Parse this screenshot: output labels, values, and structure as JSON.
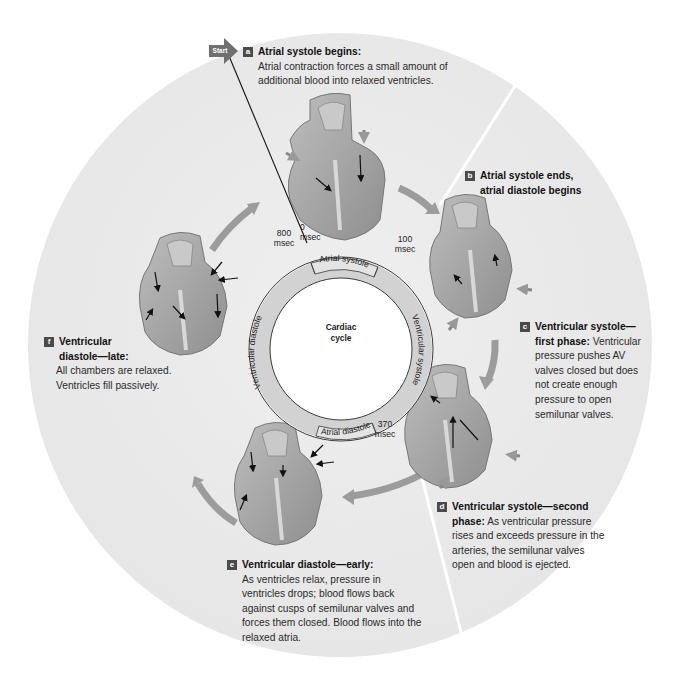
{
  "figure": {
    "title": "Cardiac cycle",
    "colors": {
      "background_disc": "#ebebeb",
      "ring_fill": "#d0d0d0",
      "ring_stroke": "#3a3a3a",
      "heart_fill": "#a8a8a8",
      "heart_dark": "#8a8a8a",
      "arrow_gray": "#9a9a9a",
      "badge": "#4a4a4a"
    }
  },
  "start_marker": {
    "label": "Start"
  },
  "center": {
    "line1": "Cardiac",
    "line2": "cycle"
  },
  "ring": {
    "segments": [
      {
        "label": "Atrial systole"
      },
      {
        "label": "Ventricular systole"
      },
      {
        "label": "Atrial diastole"
      },
      {
        "label": "Ventricular diastole"
      }
    ],
    "times": [
      {
        "value": "0",
        "unit": "msec"
      },
      {
        "value": "100",
        "unit": "msec"
      },
      {
        "value": "370",
        "unit": "msec"
      },
      {
        "value": "800",
        "unit": "msec"
      }
    ]
  },
  "steps": [
    {
      "letter": "a",
      "title": "Atrial systole begins:",
      "body": "Atrial contraction forces a small amount of additional blood into relaxed ventricles."
    },
    {
      "letter": "b",
      "title": "Atrial systole ends, atrial diastole begins",
      "body": ""
    },
    {
      "letter": "c",
      "title": "Ventricular systole— first phase:",
      "body": "Ventricular pressure pushes AV valves closed but does not create enough pressure to open semilunar valves."
    },
    {
      "letter": "d",
      "title": "Ventricular systole—second phase:",
      "body": "As ventricular pressure rises and exceeds pressure in the arteries, the semilunar valves open and blood is ejected."
    },
    {
      "letter": "e",
      "title": "Ventricular diastole—early:",
      "body": "As ventricles relax, pressure in ventricles drops; blood flows back against cusps of semilunar valves and forces them closed. Blood flows into the relaxed atria."
    },
    {
      "letter": "f",
      "title": "Ventricular diastole—late:",
      "body": "All chambers are relaxed. Ventricles fill passively."
    }
  ]
}
